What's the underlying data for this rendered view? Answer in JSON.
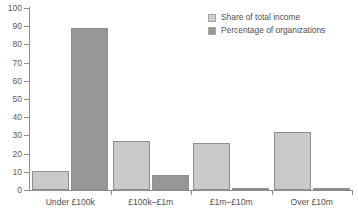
{
  "chart_data": {
    "type": "bar",
    "title": "",
    "subtitle": "",
    "xlabel": "",
    "ylabel": "",
    "ylim": [
      0,
      100
    ],
    "yticks": [
      0,
      10,
      20,
      30,
      40,
      50,
      60,
      70,
      80,
      90,
      100
    ],
    "ytick_labels": [
      "0",
      "10",
      "20",
      "30",
      "40",
      "50",
      "60",
      "70",
      "80",
      "90",
      "100"
    ],
    "grid": false,
    "legend_position": "top-right",
    "categories": [
      "Under £100k",
      "£100k–£1m",
      "£1m–£10m",
      "Over £10m"
    ],
    "series": [
      {
        "name": "Share of total income",
        "color": "#c9c9c9",
        "values": [
          10.5,
          27,
          26,
          32
        ]
      },
      {
        "name": "Percentage of organizations",
        "color": "#969696",
        "values": [
          89,
          8,
          1,
          0.5
        ]
      }
    ]
  },
  "legend": {
    "items": [
      {
        "label": "Share of total income"
      },
      {
        "label": "Percentage of organizations"
      }
    ]
  },
  "axis": {
    "y_labels": [
      "100",
      "90",
      "80",
      "70",
      "60",
      "50",
      "40",
      "30",
      "20",
      "10",
      "0"
    ],
    "x_labels": [
      "Under £100k",
      "£100k–£1m",
      "£1m–£10m",
      "Over £10m"
    ]
  },
  "colors": {
    "series_light": "#c9c9c9",
    "series_dark": "#969696",
    "axis": "#8c8c8c",
    "text": "#4f4f4f",
    "background": "#ffffff"
  }
}
